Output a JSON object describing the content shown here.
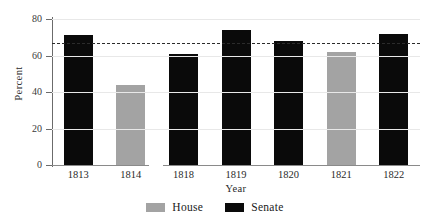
{
  "chart_data": {
    "type": "bar",
    "title": "",
    "xlabel": "Year",
    "ylabel": "Percent",
    "categories": [
      "1813",
      "1814",
      "1818",
      "1819",
      "1820",
      "1821",
      "1822"
    ],
    "series": [
      {
        "name": "House",
        "color": "#a3a3a3",
        "values": [
          null,
          44,
          null,
          null,
          null,
          62,
          null
        ]
      },
      {
        "name": "Senate",
        "color": "#0a0a0a",
        "values": [
          71,
          null,
          61,
          74,
          68,
          null,
          72
        ]
      }
    ],
    "bars": [
      {
        "category": "1813",
        "series": "Senate",
        "value": 71
      },
      {
        "category": "1814",
        "series": "House",
        "value": 44
      },
      {
        "category": "1818",
        "series": "Senate",
        "value": 61
      },
      {
        "category": "1819",
        "series": "Senate",
        "value": 74
      },
      {
        "category": "1820",
        "series": "Senate",
        "value": 68
      },
      {
        "category": "1821",
        "series": "House",
        "value": 62
      },
      {
        "category": "1822",
        "series": "Senate",
        "value": 72
      }
    ],
    "reference_line": {
      "value": 66.7,
      "style": "dashed",
      "color": "#2b2b2b"
    },
    "ylim": [
      0,
      80
    ],
    "yticks": [
      0,
      20,
      40,
      60,
      80
    ],
    "ytick_labels": [
      "0",
      "20",
      "40",
      "60",
      "80"
    ],
    "grid": true,
    "axis_break": {
      "between": [
        "1814",
        "1818"
      ],
      "present": true
    },
    "legend": {
      "position": "bottom-center",
      "entries": [
        {
          "label": "House",
          "color": "#a3a3a3"
        },
        {
          "label": "Senate",
          "color": "#0a0a0a"
        }
      ]
    }
  },
  "legend": {
    "house_label": "House",
    "senate_label": "Senate"
  },
  "axes": {
    "ylabel": "Percent",
    "xlabel": "Year"
  }
}
